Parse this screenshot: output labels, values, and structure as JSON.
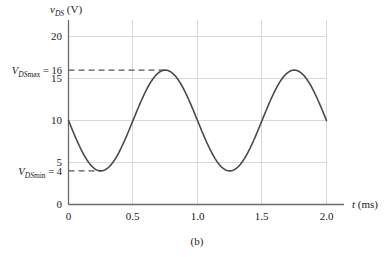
{
  "figure": {
    "caption": "(b)",
    "y_axis_title_var": "v",
    "y_axis_title_sub": "DS",
    "y_axis_title_unit": "(V)",
    "x_axis_title_var": "t",
    "x_axis_title_unit": "(ms)"
  },
  "annotations": {
    "max": {
      "var": "V",
      "sub": "DS",
      "sub_rm": "max",
      "eq": " = 16",
      "value": 16,
      "full_text": "V_DSmax = 16"
    },
    "min": {
      "var": "V",
      "sub": "DS",
      "sub_rm": "min",
      "eq": " = 4",
      "value": 4,
      "full_text": "V_DSmin = 4"
    }
  },
  "colors": {
    "curve": "#4a4a4a",
    "grid": "#d8d8d8",
    "axis": "#6b6b6b",
    "dashed": "#555555",
    "text": "#1a1a1a",
    "background": "#ffffff"
  },
  "chart_data": {
    "type": "line",
    "title": "",
    "subtitle": "",
    "xlabel": "t (ms)",
    "ylabel": "v_DS (V)",
    "xlim": [
      0,
      2.0
    ],
    "ylim": [
      0,
      22
    ],
    "grid": true,
    "legend_position": "none",
    "xticks": [
      0,
      0.5,
      1.0,
      1.5,
      2.0
    ],
    "xtick_labels": [
      "0",
      "0.5",
      "1.0",
      "1.5",
      "2.0"
    ],
    "yticks": [
      0,
      4,
      5,
      10,
      15,
      16,
      20
    ],
    "ytick_labels": [
      "0",
      "4",
      "5",
      "10",
      "15",
      "16",
      "20"
    ],
    "ygridlines": [
      5,
      10,
      15,
      20
    ],
    "series": [
      {
        "name": "v_DS(t)",
        "equation": "10 - 6*cos(2*pi*(t - 0.25))",
        "dc_offset": 10,
        "amplitude": 6,
        "period_ms": 1.0,
        "x": [
          0,
          0.05,
          0.1,
          0.15,
          0.2,
          0.25,
          0.3,
          0.35,
          0.4,
          0.45,
          0.5,
          0.55,
          0.6,
          0.65,
          0.7,
          0.75,
          0.8,
          0.85,
          0.9,
          0.95,
          1.0,
          1.05,
          1.1,
          1.15,
          1.2,
          1.25,
          1.3,
          1.35,
          1.4,
          1.45,
          1.5,
          1.55,
          1.6,
          1.65,
          1.7,
          1.75,
          1.8,
          1.85,
          1.9,
          1.95,
          2.0
        ],
        "y": [
          10.0,
          8.15,
          6.48,
          5.15,
          4.29,
          4.0,
          4.29,
          5.15,
          6.48,
          8.15,
          10.0,
          11.85,
          13.52,
          14.85,
          15.71,
          16.0,
          15.71,
          14.85,
          13.52,
          11.85,
          10.0,
          8.15,
          6.48,
          5.15,
          4.29,
          4.0,
          4.29,
          5.15,
          6.48,
          8.15,
          10.0,
          11.85,
          13.52,
          14.85,
          15.71,
          16.0,
          15.71,
          14.85,
          13.52,
          11.85,
          10.0
        ]
      }
    ],
    "annotations": [
      {
        "label": "V_DSmax = 16",
        "y": 16,
        "style": "dashed-horizontal",
        "x_end": 0.75
      },
      {
        "label": "V_DSmin = 4",
        "y": 4,
        "style": "dashed-horizontal",
        "x_end": 0.25
      }
    ]
  }
}
